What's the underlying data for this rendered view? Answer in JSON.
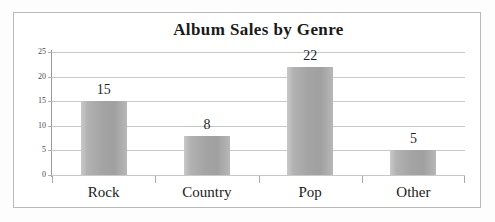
{
  "chart_data": {
    "type": "bar",
    "title": "Album Sales by Genre",
    "xlabel": "",
    "ylabel": "",
    "categories": [
      "Rock",
      "Country",
      "Pop",
      "Other"
    ],
    "values": [
      15,
      8,
      22,
      5
    ],
    "data_labels": [
      "15",
      "8",
      "22",
      "5"
    ],
    "ylim": [
      0,
      25
    ],
    "ytick_labels": [
      "0",
      "5",
      "10",
      "15",
      "20",
      "25"
    ],
    "ytick_values": [
      0,
      5,
      10,
      15,
      20,
      25
    ],
    "grid": "horizontal",
    "legend": "none",
    "bar_color": "#a8a8a8",
    "text_color": "#1a1a1a",
    "gridline_color": "#c8c8c8",
    "axis_color": "#9a9a9a",
    "frame_color": "#b9b9b9",
    "background_color": "#ffffff"
  }
}
